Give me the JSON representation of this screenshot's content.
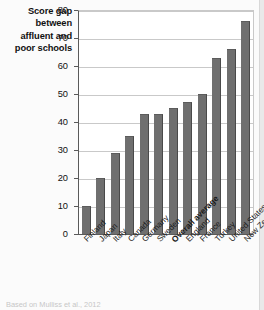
{
  "chart_data": {
    "type": "bar",
    "title": "Score gap between affluent and poor schools",
    "title_lines": [
      "Score gap",
      "between",
      "affluent and",
      "poor schools"
    ],
    "xlabel": "",
    "ylabel": "Score gap between affluent and poor schools",
    "ylim": [
      0,
      80
    ],
    "ytick_step": 10,
    "yticks": [
      0,
      10,
      20,
      30,
      40,
      50,
      60,
      70,
      80
    ],
    "grid": true,
    "legend": false,
    "bar_color": "#6f6f6f",
    "categories": [
      "Finland",
      "Japan",
      "Italy",
      "Canada",
      "Germany",
      "Sweden",
      "Overall average",
      "England",
      "France",
      "Turkey",
      "United States",
      "New Zealand"
    ],
    "values": [
      10,
      20,
      29,
      35,
      43,
      43,
      45,
      47,
      50,
      63,
      66,
      76
    ],
    "highlighted_category": "Overall average",
    "annotations": []
  },
  "source_note": "Based on Mulliss et al., 2012"
}
